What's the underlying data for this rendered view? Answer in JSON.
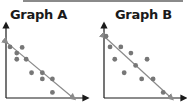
{
  "header": {
    "bar_color": "#8a8a8a"
  },
  "chart_data": [
    {
      "type": "scatter",
      "title": "Graph A",
      "xlabel": "",
      "ylabel": "",
      "grid": false,
      "trend_line": {
        "x0": 0,
        "y0": 10,
        "x1": 10,
        "y1": 0
      },
      "points": [
        {
          "x": 0.6,
          "y": 9.1
        },
        {
          "x": 1.6,
          "y": 8.0
        },
        {
          "x": 2.4,
          "y": 9.0
        },
        {
          "x": 1.6,
          "y": 6.9
        },
        {
          "x": 3.0,
          "y": 6.9
        },
        {
          "x": 3.8,
          "y": 4.5
        },
        {
          "x": 5.4,
          "y": 4.5
        },
        {
          "x": 5.4,
          "y": 3.4
        },
        {
          "x": 6.9,
          "y": 3.4
        },
        {
          "x": 6.9,
          "y": 1.0
        }
      ],
      "xlim": [
        0,
        11
      ],
      "ylim": [
        0,
        13
      ]
    },
    {
      "type": "scatter",
      "title": "Graph B",
      "xlabel": "",
      "ylabel": "",
      "grid": false,
      "trend_line": {
        "x0": 0,
        "y0": 11,
        "x1": 10,
        "y1": 0
      },
      "points": [
        {
          "x": 0.3,
          "y": 11.0
        },
        {
          "x": 0.9,
          "y": 9.1
        },
        {
          "x": 2.5,
          "y": 9.1
        },
        {
          "x": 1.6,
          "y": 6.9
        },
        {
          "x": 4.0,
          "y": 8.0
        },
        {
          "x": 4.7,
          "y": 5.8
        },
        {
          "x": 6.4,
          "y": 6.9
        },
        {
          "x": 3.0,
          "y": 4.5
        },
        {
          "x": 5.6,
          "y": 3.4
        },
        {
          "x": 7.3,
          "y": 3.4
        },
        {
          "x": 8.8,
          "y": 1.0
        }
      ],
      "xlim": [
        0,
        11
      ],
      "ylim": [
        0,
        13
      ]
    }
  ],
  "graphs": {
    "a": {
      "title": "Graph A"
    },
    "b": {
      "title": "Graph B"
    }
  },
  "colors": {
    "axis": "#1a1a1a",
    "point": "#777777",
    "line": "#8a8a8a"
  }
}
